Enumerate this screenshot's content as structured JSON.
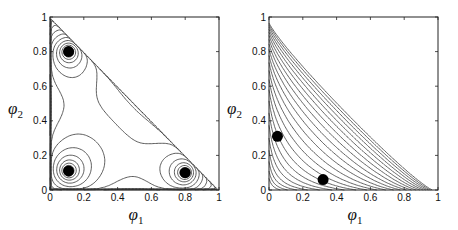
{
  "chart_data": [
    {
      "type": "contour",
      "title": "",
      "xlabel": "φ1",
      "ylabel": "φ2",
      "xlim": [
        0,
        1
      ],
      "ylim": [
        0,
        1
      ],
      "xticks": [
        "0",
        "0.2",
        "0.4",
        "0.6",
        "0.8",
        "1"
      ],
      "yticks": [
        "0",
        "0.2",
        "0.4",
        "0.6",
        "0.8",
        "1"
      ],
      "grid": false,
      "domain": "triangle φ1 + φ2 ≤ 1",
      "description": "Contour plot of a three-well free energy over the ternary composition triangle; saddle region near the center (~0.3, 0.3).",
      "markers": [
        {
          "x": 0.11,
          "y": 0.8
        },
        {
          "x": 0.11,
          "y": 0.11
        },
        {
          "x": 0.8,
          "y": 0.1
        }
      ]
    },
    {
      "type": "contour",
      "title": "",
      "xlabel": "φ1",
      "ylabel": "φ2",
      "xlim": [
        0,
        1
      ],
      "ylim": [
        0,
        1
      ],
      "xticks": [
        "0",
        "0.2",
        "0.4",
        "0.6",
        "0.8",
        "1"
      ],
      "yticks": [
        "0",
        "0.2",
        "0.4",
        "0.6",
        "0.8",
        "1"
      ],
      "grid": false,
      "domain": "triangle φ1 + φ2 ≤ 1",
      "description": "Contour plot with nested level curves bending from the φ2 axis toward the φ1 axis, densely packed toward the hypotenuse.",
      "markers": [
        {
          "x": 0.05,
          "y": 0.31
        },
        {
          "x": 0.32,
          "y": 0.06
        }
      ]
    }
  ],
  "labels": {
    "x_symbol": "φ",
    "x_sub": "1",
    "y_symbol": "φ",
    "y_sub": "2"
  }
}
